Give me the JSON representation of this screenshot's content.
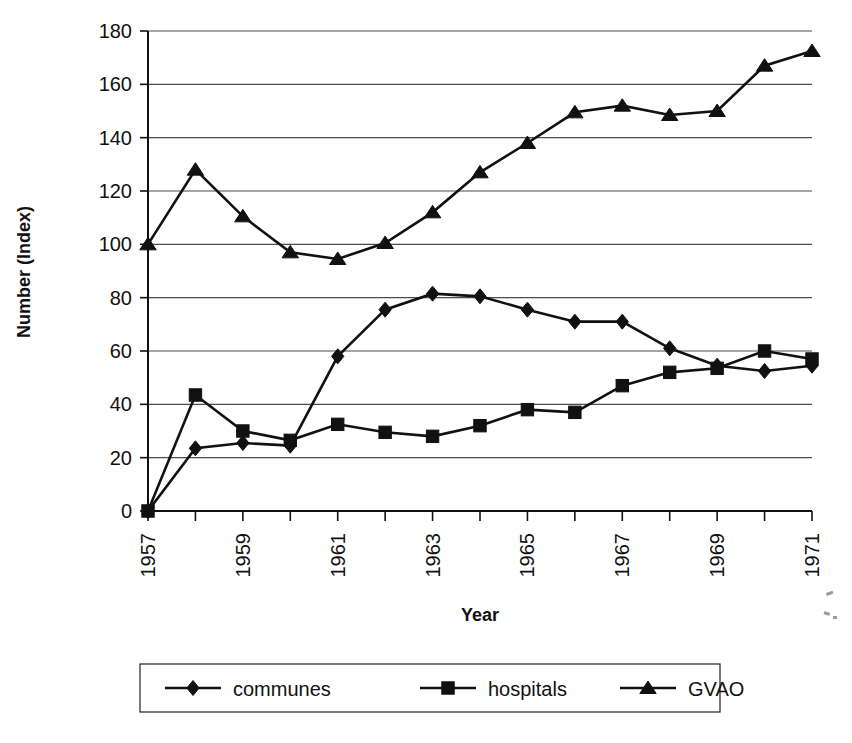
{
  "chart_data": {
    "type": "line",
    "title": "",
    "xlabel": "Year",
    "ylabel": "Number (Index)",
    "x": [
      1957,
      1958,
      1959,
      1960,
      1961,
      1962,
      1963,
      1964,
      1965,
      1966,
      1967,
      1968,
      1969,
      1970,
      1971
    ],
    "categories": [
      "1957",
      "1958",
      "1959",
      "1960",
      "1961",
      "1962",
      "1963",
      "1964",
      "1965",
      "1966",
      "1967",
      "1968",
      "1969",
      "1970",
      "1971"
    ],
    "xtick_labels": [
      "1957",
      "",
      "1959",
      "",
      "1961",
      "",
      "1963",
      "",
      "1965",
      "",
      "1967",
      "",
      "1969",
      "",
      "1971"
    ],
    "ytick_labels": [
      "0",
      "20",
      "40",
      "60",
      "80",
      "100",
      "120",
      "140",
      "160",
      "180"
    ],
    "yticks": [
      0,
      20,
      40,
      60,
      80,
      100,
      120,
      140,
      160,
      180
    ],
    "ylim": [
      0,
      180
    ],
    "xlim": [
      1957,
      1971
    ],
    "grid": "horizontal",
    "legend_position": "bottom",
    "series": [
      {
        "name": "communes",
        "marker": "diamond",
        "color": "#111111",
        "values": [
          0,
          23.5,
          25.5,
          24.5,
          58,
          75.5,
          81.5,
          80.5,
          75.5,
          71,
          71,
          61,
          54.5,
          52.5,
          54.5
        ]
      },
      {
        "name": "hospitals",
        "marker": "square",
        "color": "#111111",
        "values": [
          0,
          43.5,
          30,
          26.5,
          32.5,
          29.5,
          28,
          32,
          38,
          37,
          47,
          52,
          53.5,
          60,
          57
        ]
      },
      {
        "name": "GVAO",
        "marker": "triangle",
        "color": "#111111",
        "values": [
          100,
          128,
          110.5,
          97,
          94.5,
          100.5,
          112,
          127,
          138,
          149.5,
          152,
          148.5,
          150,
          167,
          172.5
        ]
      }
    ]
  },
  "axes": {
    "y_title": "Number (Index)",
    "x_title": "Year"
  },
  "legend": {
    "entries": [
      {
        "label": "communes",
        "marker": "diamond"
      },
      {
        "label": "hospitals",
        "marker": "square"
      },
      {
        "label": "GVAO",
        "marker": "triangle"
      }
    ]
  }
}
